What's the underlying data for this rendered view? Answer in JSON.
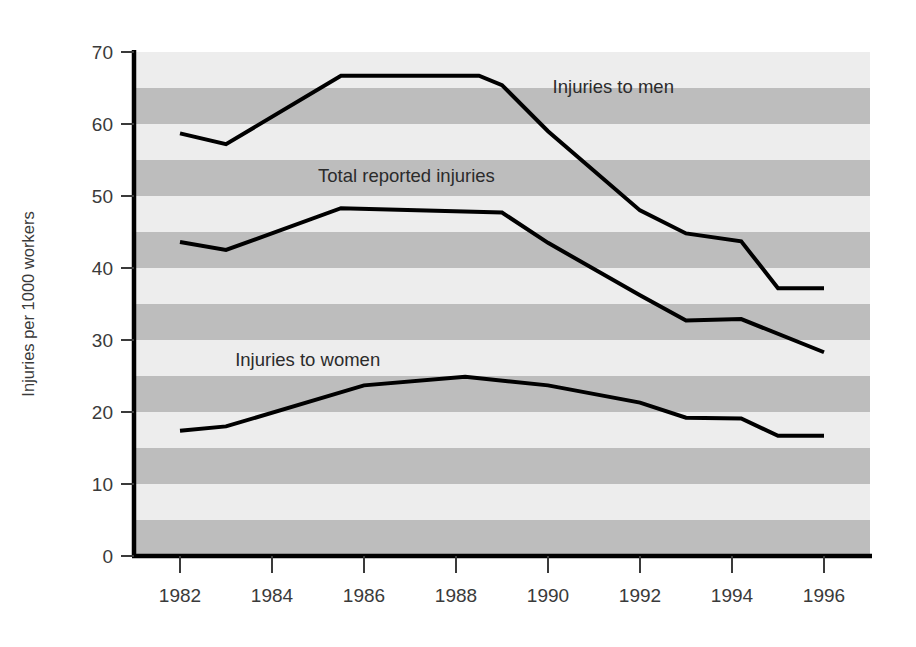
{
  "chart_data": {
    "type": "line",
    "title": "",
    "subtitle": "",
    "xlabel": "",
    "ylabel": "Injuries per 1000 workers",
    "xlim": [
      1981.0,
      1997.0
    ],
    "ylim": [
      0,
      70
    ],
    "x_ticks": [
      1982,
      1984,
      1986,
      1988,
      1990,
      1992,
      1994,
      1996
    ],
    "x_tick_labels": [
      "1982",
      "1984",
      "1986",
      "1988",
      "1990",
      "1992",
      "1994",
      "1996"
    ],
    "y_ticks": [
      0,
      10,
      20,
      30,
      40,
      50,
      60,
      70
    ],
    "y_tick_labels": [
      "0",
      "10",
      "20",
      "30",
      "40",
      "50",
      "60",
      "70"
    ],
    "grid": "horizontal alternating shaded bands every 5 units",
    "legend_position": "inline annotations on plot",
    "band_light_color": "#ededed",
    "band_dark_color": "#bdbdbd",
    "line_color": "#000000",
    "line_width_px": 4,
    "band_step": 5,
    "series": [
      {
        "name": "Injuries to men",
        "label": "Injuries to men",
        "label_x": 1990.1,
        "label_y": 64.3,
        "x": [
          1982.0,
          1983.0,
          1985.5,
          1988.5,
          1989.0,
          1990.0,
          1992.0,
          1993.0,
          1994.2,
          1995.0,
          1996.0
        ],
        "values": [
          58.7,
          57.2,
          66.7,
          66.7,
          65.4,
          59.0,
          48.0,
          44.8,
          43.7,
          37.2,
          37.2
        ]
      },
      {
        "name": "Total reported injuries",
        "label": "Total reported injuries",
        "label_x": 1985.0,
        "label_y": 52.0,
        "x": [
          1982.0,
          1983.0,
          1985.5,
          1989.0,
          1990.0,
          1992.0,
          1993.0,
          1994.2,
          1996.0
        ],
        "values": [
          43.6,
          42.5,
          48.3,
          47.7,
          43.5,
          36.2,
          32.7,
          32.9,
          28.3
        ]
      },
      {
        "name": "Injuries to women",
        "label": "Injuries to women",
        "label_x": 1983.2,
        "label_y": 26.4,
        "x": [
          1982.0,
          1983.0,
          1986.0,
          1988.2,
          1990.0,
          1992.0,
          1993.0,
          1994.2,
          1995.0,
          1996.0
        ],
        "values": [
          17.4,
          18.0,
          23.7,
          24.9,
          23.7,
          21.3,
          19.2,
          19.1,
          16.7,
          16.7
        ]
      }
    ]
  }
}
